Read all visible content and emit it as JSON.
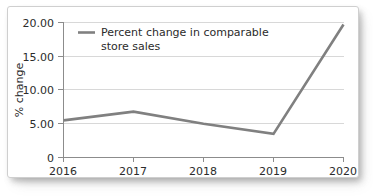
{
  "chart_data": {
    "type": "line",
    "title": "",
    "xlabel": "",
    "ylabel": "% change",
    "x": [
      2016,
      2017,
      2018,
      2019,
      2020
    ],
    "categories": [
      "2016",
      "2017",
      "2018",
      "2019",
      "2020"
    ],
    "series": [
      {
        "name": "Percent change in comparable store sales",
        "values": [
          5.5,
          6.8,
          5.0,
          3.5,
          19.7
        ],
        "color": "#808080"
      }
    ],
    "ylim": [
      0,
      20
    ],
    "yticks": [
      0,
      5,
      10,
      15,
      20
    ],
    "ytick_labels": [
      "0",
      "5.00",
      "10.00",
      "15.00",
      "20.00"
    ],
    "xtick_labels": [
      "2016",
      "2017",
      "2018",
      "2019",
      "2020"
    ],
    "grid": "horizontal",
    "legend_position": "top-left",
    "legend_entries": [
      {
        "label_line1": "Percent change in comparable",
        "label_line2": "store sales",
        "color": "#808080"
      }
    ]
  },
  "axes": {
    "y_title": "% change",
    "y_ticks": [
      {
        "label": "20.00",
        "value": 20
      },
      {
        "label": "15.00",
        "value": 15
      },
      {
        "label": "10.00",
        "value": 10
      },
      {
        "label": "5.00",
        "value": 5
      },
      {
        "label": "0",
        "value": 0
      }
    ],
    "x_ticks": [
      {
        "label": "2016",
        "value": 2016
      },
      {
        "label": "2017",
        "value": 2017
      },
      {
        "label": "2018",
        "value": 2018
      },
      {
        "label": "2019",
        "value": 2019
      },
      {
        "label": "2020",
        "value": 2020
      }
    ]
  },
  "legend": {
    "line1": "Percent change in comparable",
    "line2": "store sales"
  },
  "colors": {
    "series": "#808080",
    "gridline": "#d8d8d8",
    "axis": "#8c8c8c",
    "text": "#2b2b2b",
    "card_background": "#ffffff",
    "card_border": "#cfcfcf"
  }
}
